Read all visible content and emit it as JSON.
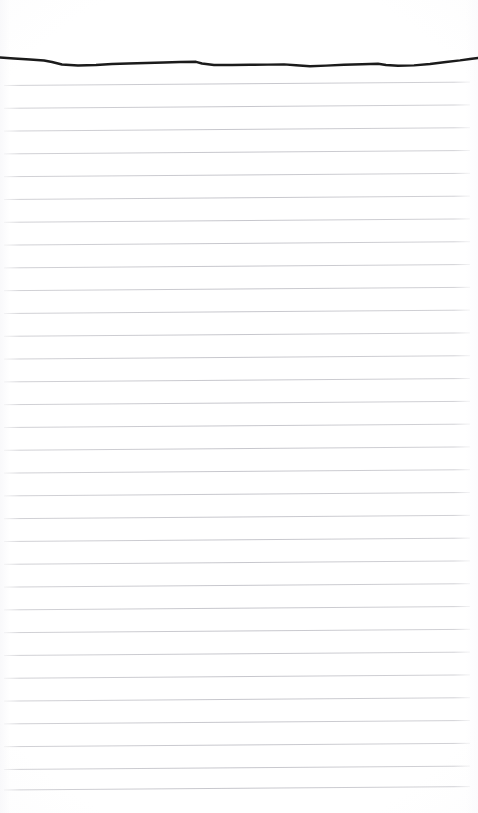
{
  "document": {
    "kind": "scanned-ruled-notepad-page",
    "title": "Blank Lined Notepad Page",
    "orientation": "portrait",
    "width_px": 478,
    "height_px": 813,
    "text_content": "",
    "handwriting_present": false,
    "printed_text_present": false
  },
  "colors": {
    "paper": "#ffffff",
    "rule_line": "#c9c9ce",
    "rule_line_faint": "#dddde2",
    "top_stroke": "#1b1b1b",
    "vignette": "#f6f6f8"
  },
  "top_stroke": {
    "name": "torn-top-edge-stroke",
    "description": "thick dark hand-drawn horizontal stroke near the top of the page",
    "stroke_color": "#1b1b1b",
    "stroke_width_px": 2.4,
    "start_x": 0,
    "start_y": 58,
    "end_x": 478,
    "end_y": 57,
    "path": "M 0 57.5 L 14 58.5 L 30 59.5 L 44 60.5 L 52 62 L 62 64.5 L 78 65.5 L 96 65 L 112 64 L 128 63.5 L 146 63 L 164 62.5 L 180 62 L 196 61.8 L 202 63.5 L 214 65 L 232 65 L 250 64.8 L 268 64.6 L 284 64.4 L 296 65.2 L 310 66.2 L 326 65.6 L 344 64.8 L 362 64.2 L 378 63.8 L 386 65 L 398 65.8 L 414 65.4 L 430 64 L 446 62 L 460 60.4 L 470 59 L 478 58"
  },
  "ruled_grid": {
    "name": "horizontal-ruled-lines",
    "line_count": 33,
    "first_line_y_left": 85.5,
    "spacing_px": 22.8,
    "slope_rise_px": -3.4,
    "line_start_x": 4,
    "line_end_x": 470,
    "line_thickness_px": 1,
    "line_color": "#c9c9ce",
    "lines": [
      {
        "index": 1,
        "y_left": 85.5,
        "y_right": 82.1
      },
      {
        "index": 2,
        "y_left": 108.3,
        "y_right": 104.9
      },
      {
        "index": 3,
        "y_left": 131.1,
        "y_right": 127.7
      },
      {
        "index": 4,
        "y_left": 153.9,
        "y_right": 150.5
      },
      {
        "index": 5,
        "y_left": 176.7,
        "y_right": 173.3
      },
      {
        "index": 6,
        "y_left": 199.5,
        "y_right": 196.1
      },
      {
        "index": 7,
        "y_left": 222.3,
        "y_right": 218.9
      },
      {
        "index": 8,
        "y_left": 245.1,
        "y_right": 241.7
      },
      {
        "index": 9,
        "y_left": 267.9,
        "y_right": 264.5
      },
      {
        "index": 10,
        "y_left": 290.7,
        "y_right": 287.3
      },
      {
        "index": 11,
        "y_left": 313.5,
        "y_right": 310.1
      },
      {
        "index": 12,
        "y_left": 336.3,
        "y_right": 332.9
      },
      {
        "index": 13,
        "y_left": 359.1,
        "y_right": 355.7
      },
      {
        "index": 14,
        "y_left": 381.9,
        "y_right": 378.5
      },
      {
        "index": 15,
        "y_left": 404.7,
        "y_right": 401.3
      },
      {
        "index": 16,
        "y_left": 427.5,
        "y_right": 424.1
      },
      {
        "index": 17,
        "y_left": 450.3,
        "y_right": 446.9
      },
      {
        "index": 18,
        "y_left": 473.1,
        "y_right": 469.7
      },
      {
        "index": 19,
        "y_left": 495.9,
        "y_right": 492.5
      },
      {
        "index": 20,
        "y_left": 518.7,
        "y_right": 515.3
      },
      {
        "index": 21,
        "y_left": 541.5,
        "y_right": 538.1
      },
      {
        "index": 22,
        "y_left": 564.3,
        "y_right": 560.9
      },
      {
        "index": 23,
        "y_left": 587.1,
        "y_right": 583.7
      },
      {
        "index": 24,
        "y_left": 609.9,
        "y_right": 606.5
      },
      {
        "index": 25,
        "y_left": 632.7,
        "y_right": 629.3
      },
      {
        "index": 26,
        "y_left": 655.5,
        "y_right": 652.1
      },
      {
        "index": 27,
        "y_left": 678.3,
        "y_right": 674.9
      },
      {
        "index": 28,
        "y_left": 701.1,
        "y_right": 697.7
      },
      {
        "index": 29,
        "y_left": 723.9,
        "y_right": 720.5
      },
      {
        "index": 30,
        "y_left": 746.7,
        "y_right": 743.3
      },
      {
        "index": 31,
        "y_left": 769.5,
        "y_right": 766.1
      },
      {
        "index": 32,
        "y_left": 790.0,
        "y_right": 786.6
      }
    ]
  },
  "margins": {
    "top_blank_px": 55,
    "bottom_blank_px": 23
  }
}
